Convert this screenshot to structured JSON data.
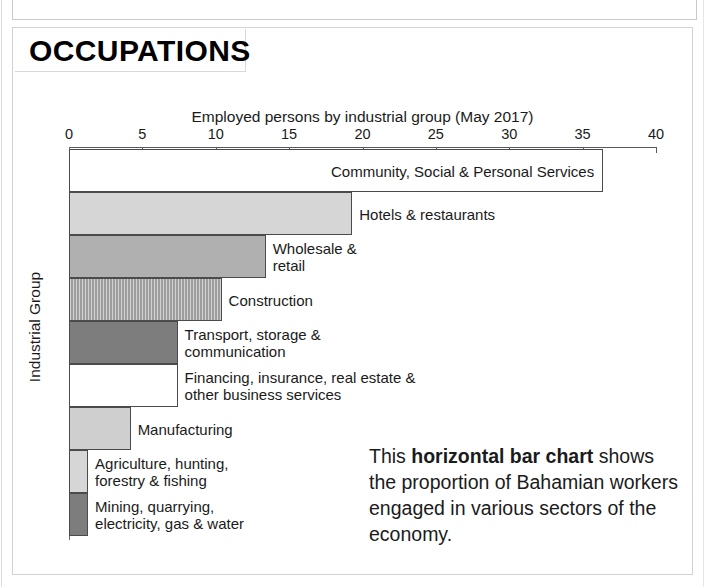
{
  "top_clipped_note": "the proportion of Bahamian workers engaged in various sectors",
  "header": {
    "title": "OCCUPATIONS"
  },
  "caption": {
    "lead": "This ",
    "bold": "horizontal bar chart",
    "rest": " shows the proportion of Bahamian workers engaged in various sectors of the economy."
  },
  "chart_data": {
    "type": "bar",
    "orientation": "horizontal",
    "title": "Employed persons by industrial group (May 2017)",
    "xlabel": "",
    "ylabel": "Industrial Group",
    "xlim": [
      0,
      40
    ],
    "xticks": [
      0,
      5,
      10,
      15,
      20,
      25,
      30,
      35,
      40
    ],
    "xticklabels": [
      "0",
      "5",
      "10",
      "15",
      "20",
      "25",
      "30",
      "35",
      "40"
    ],
    "grid": false,
    "legend": "none",
    "categories": [
      "Community, Social & Personal Services",
      "Hotels & restaurants",
      "Wholesale & retail",
      "Construction",
      "Transport, storage & communication",
      "Financing, insurance, real estate & other business services",
      "Manufacturing",
      "Agriculture, hunting, forestry & fishing",
      "Mining, quarrying, electricity, gas & water"
    ],
    "values": [
      36.4,
      19.3,
      13.4,
      10.4,
      7.4,
      7.4,
      4.2,
      1.3,
      1.3
    ],
    "bars": [
      {
        "label": "Community, Social & Personal Services",
        "value": 36.4,
        "fill": "fill-white",
        "label_position": "inside"
      },
      {
        "label": "Hotels & restaurants",
        "value": 19.3,
        "fill": "fill-light",
        "label_position": "outside"
      },
      {
        "label": "Wholesale &\nretail",
        "value": 13.4,
        "fill": "fill-medium",
        "label_position": "outside"
      },
      {
        "label": "Construction",
        "value": 10.4,
        "fill": "fill-hatch",
        "label_position": "outside"
      },
      {
        "label": "Transport, storage &\ncommunication",
        "value": 7.4,
        "fill": "fill-dark",
        "label_position": "outside"
      },
      {
        "label": "Financing, insurance, real estate &\nother business services",
        "value": 7.4,
        "fill": "fill-white",
        "label_position": "outside"
      },
      {
        "label": "Manufacturing",
        "value": 4.2,
        "fill": "fill-litgray",
        "label_position": "outside"
      },
      {
        "label": "Agriculture, hunting,\nforestry & fishing",
        "value": 1.3,
        "fill": "fill-light",
        "label_position": "outside"
      },
      {
        "label": "Mining, quarrying,\nelectricity, gas & water",
        "value": 1.3,
        "fill": "fill-dark",
        "label_position": "outside"
      }
    ],
    "colors": {
      "white": "#ffffff",
      "light": "#d6d6d6",
      "medium": "#b0b0b0",
      "hatch": "#9d9d9d",
      "dark": "#7d7d7d",
      "litgray": "#cfcfcf",
      "outline": "#4b4b4b"
    }
  }
}
